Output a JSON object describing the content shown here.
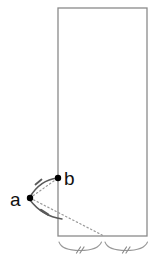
{
  "figure": {
    "background_color": "#ffffff",
    "stroke_color": "#808080",
    "dot_color": "#000000",
    "arc_color": "#555555",
    "dotted_color": "#999999",
    "label_color": "#111111"
  },
  "shape": {
    "name": "rectangle",
    "left": 58,
    "top": 8,
    "right": 147,
    "bottom": 236,
    "width": 89,
    "height": 228,
    "stroke_width": 1.2
  },
  "points": [
    {
      "id": "a",
      "label": "a",
      "x": 30,
      "y": 198,
      "label_x": 13,
      "label_y": 205,
      "radius": 3.2
    },
    {
      "id": "b",
      "label": "b",
      "x": 58,
      "y": 178,
      "label_x": 64,
      "label_y": 177,
      "radius": 3.2
    }
  ],
  "arcs": [
    {
      "id": "arc-a-to-b-upper",
      "style": "solid",
      "tick_marks": 1,
      "from": "a",
      "to": "b"
    },
    {
      "id": "arc-a-to-corner-lower",
      "style": "solid",
      "tick_marks": 1,
      "from": "a",
      "to": "bottom-edge"
    }
  ],
  "dotted_lines": [
    {
      "id": "dotted-a-to-b",
      "from": "a",
      "to": "b"
    },
    {
      "id": "dotted-a-to-bottom",
      "from": "a",
      "to": "bottom-point"
    }
  ],
  "braces": [
    {
      "id": "brace-left",
      "x_start": 58,
      "x_end": 103,
      "y": 242,
      "tick_label": "//",
      "tick_marks": 2
    },
    {
      "id": "brace-right",
      "x_start": 103,
      "x_end": 148,
      "y": 242,
      "tick_label": "//",
      "tick_marks": 2
    }
  ],
  "labels": {
    "point_a": "a",
    "point_b": "b"
  }
}
